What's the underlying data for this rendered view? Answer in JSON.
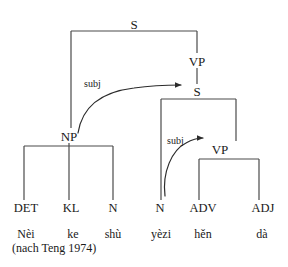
{
  "figure": {
    "type": "syntax-tree-diagram",
    "line_color": "#3a3a3a",
    "text_color": "#1a1a1a",
    "background_color": "#ffffff"
  },
  "nodes": {
    "s_top": {
      "label": "S",
      "x": 134,
      "y": 24
    },
    "vp_upper": {
      "label": "VP",
      "x": 197,
      "y": 62
    },
    "s_lower": {
      "label": "S",
      "x": 197,
      "y": 92
    },
    "np": {
      "label": "NP",
      "x": 69,
      "y": 137
    },
    "vp_lower": {
      "label": "VP",
      "x": 220,
      "y": 150
    }
  },
  "terminals": [
    {
      "label": "DET",
      "x": 26,
      "y": 208
    },
    {
      "label": "KL",
      "x": 71,
      "y": 208
    },
    {
      "label": "N",
      "x": 113,
      "y": 208
    },
    {
      "label": "N",
      "x": 160,
      "y": 208
    },
    {
      "label": "ADV",
      "x": 203,
      "y": 208
    },
    {
      "label": "ADJ",
      "x": 263,
      "y": 208
    }
  ],
  "words": [
    {
      "text": "Nèi",
      "x": 26,
      "y": 234
    },
    {
      "text": "ke",
      "x": 73,
      "y": 234
    },
    {
      "text": "shù",
      "x": 113,
      "y": 234
    },
    {
      "text": "yèzi",
      "x": 161,
      "y": 234
    },
    {
      "text": "hěn",
      "x": 203,
      "y": 234
    },
    {
      "text": "dà",
      "x": 262,
      "y": 234
    }
  ],
  "arrow_labels": [
    {
      "text": "subj",
      "x": 84,
      "y": 84
    },
    {
      "text": "subj",
      "x": 167,
      "y": 141
    }
  ],
  "source_note": {
    "text": "(nach Teng 1974)",
    "x": 12,
    "y": 248
  },
  "edges": {
    "s_top_bar": {
      "x1": 71,
      "x2": 197,
      "y": 31
    },
    "s_top_left_leg": {
      "x": 71,
      "y1": 31,
      "y2": 128
    },
    "s_top_right_leg": {
      "x": 197,
      "y1": 31,
      "y2": 53
    },
    "vp_s_link": {
      "x": 197,
      "y1": 68,
      "y2": 84
    },
    "s_lower_bar": {
      "x1": 161,
      "x2": 236,
      "y": 99
    },
    "s_lower_left_leg": {
      "x": 161,
      "y1": 99,
      "y2": 200
    },
    "s_lower_right_leg": {
      "x": 236,
      "y1": 99,
      "y2": 141
    },
    "np_bar": {
      "x1": 24,
      "x2": 113,
      "y": 146
    },
    "np_stem": {
      "x": 69,
      "y1": 143,
      "y2": 146
    },
    "np_legs": [
      {
        "x": 24,
        "y1": 146,
        "y2": 200
      },
      {
        "x": 69,
        "y1": 146,
        "y2": 200
      },
      {
        "x": 113,
        "y1": 146,
        "y2": 200
      }
    ],
    "vp_lower_bar": {
      "x1": 199,
      "x2": 259,
      "y": 159
    },
    "vp_lower_legs": [
      {
        "x": 199,
        "y1": 159,
        "y2": 200
      },
      {
        "x": 259,
        "y1": 159,
        "y2": 200
      }
    ]
  },
  "curved_arrows": [
    {
      "name": "np-to-s-subj",
      "path": "M 78 133 C 82 108, 100 92, 134 88 C 155 85, 170 85, 181 85",
      "arrowhead_x": 188,
      "arrowhead_y": 85
    },
    {
      "name": "n-to-vp-subj",
      "path": "M 165 196 C 163 172, 173 150, 187 143 C 194 139, 199 138, 204 138",
      "arrowhead_x": 210,
      "arrowhead_y": 138
    }
  ]
}
